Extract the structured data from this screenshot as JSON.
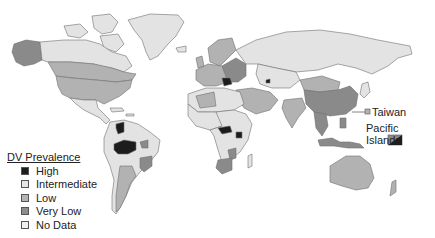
{
  "legend": {
    "title": "DV Prevalence",
    "items": [
      {
        "label": "High",
        "color": "#1c1c1c"
      },
      {
        "label": "Intermediate",
        "color": "#e6e6e6"
      },
      {
        "label": "Low",
        "color": "#b4b4b4"
      },
      {
        "label": "Very Low",
        "color": "#8c8c8c"
      },
      {
        "label": "No Data",
        "color": "#f0f0f0"
      }
    ]
  },
  "annotations": {
    "taiwan": "Taiwan",
    "pacific_islands": "Pacific Islands"
  },
  "colors": {
    "high": "#1c1c1c",
    "intermediate": "#e3e3e3",
    "low": "#b2b2b2",
    "very_low": "#8a8a8a",
    "no_data": "#efefef",
    "ocean": "#ffffff"
  }
}
